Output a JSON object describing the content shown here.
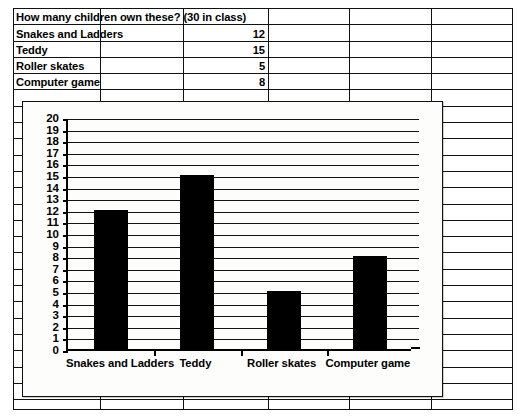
{
  "worksheet": {
    "title_cell": "How many children own these? (30 in class)",
    "rows": [
      {
        "label": "Snakes and Ladders",
        "value": "12"
      },
      {
        "label": "Teddy",
        "value": "15"
      },
      {
        "label": "Roller skates",
        "value": "5"
      },
      {
        "label": "Computer game",
        "value": "8"
      }
    ],
    "empty_column_count": 3
  },
  "chart_data": {
    "type": "bar",
    "title": "",
    "subtitle": "",
    "xlabel": "",
    "ylabel": "",
    "categories": [
      "Snakes and Ladders",
      "Teddy",
      "Roller skates",
      "Computer game"
    ],
    "values": [
      12,
      15,
      5,
      8
    ],
    "ylim": [
      0,
      20
    ],
    "ytick_step": 1,
    "ytick_labels": [
      "20",
      "19",
      "18",
      "17",
      "16",
      "15",
      "14",
      "13",
      "12",
      "11",
      "10",
      "9",
      "8",
      "7",
      "6",
      "5",
      "4",
      "3",
      "2",
      "1",
      "0"
    ],
    "grid": true,
    "grid_axis": "y",
    "legend": false,
    "legend_position": "none",
    "bar_color": "#000000",
    "axis_color": "#000000",
    "plot_background": "#FDFDFB"
  },
  "colors": {
    "ink": "#111111",
    "paper": "#FFFFFF",
    "bar": "#000000"
  }
}
